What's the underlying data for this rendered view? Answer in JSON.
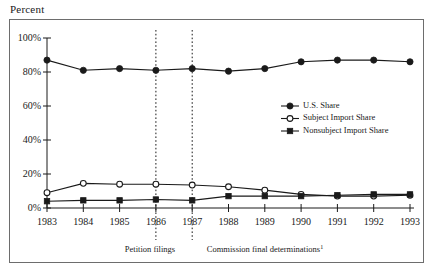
{
  "figure": {
    "axis_caption": "Percent",
    "footnote_marker": "1"
  },
  "chart_data": {
    "type": "line",
    "title": "",
    "xlabel": "",
    "ylabel": "Percent",
    "categories": [
      "1983",
      "1984",
      "1985",
      "1986",
      "1987",
      "1988",
      "1989",
      "1990",
      "1991",
      "1992",
      "1993"
    ],
    "x": [
      1983,
      1984,
      1985,
      1986,
      1987,
      1988,
      1989,
      1990,
      1991,
      1992,
      1993
    ],
    "xlim": [
      1983,
      1993
    ],
    "ylim": [
      0,
      100
    ],
    "ytick_labels": [
      "0%",
      "20%",
      "40%",
      "60%",
      "80%",
      "100%"
    ],
    "ytick_values": [
      0,
      20,
      40,
      60,
      80,
      100
    ],
    "grid": false,
    "legend_position": "center-right",
    "series": [
      {
        "name": "U.S. Share",
        "marker": "filled-circle",
        "values": [
          87,
          81,
          82,
          81,
          82,
          80.5,
          82,
          86,
          87,
          87,
          86
        ]
      },
      {
        "name": "Subject Import Share",
        "marker": "open-circle",
        "values": [
          9,
          14.5,
          14,
          14,
          13.5,
          12.5,
          10.5,
          8,
          7,
          7,
          7.5
        ]
      },
      {
        "name": "Nonsubject Import Share",
        "marker": "filled-square",
        "values": [
          4,
          4.5,
          4.5,
          5,
          4.5,
          7,
          7,
          7,
          7.5,
          8,
          8
        ]
      }
    ],
    "annotations": [
      {
        "label": "Petition filings",
        "at_x": 1986
      },
      {
        "label": "Commission final determinations",
        "at_x": 1987,
        "superscript": "1"
      }
    ]
  },
  "legend": {
    "items": [
      {
        "label": "U.S. Share",
        "marker": "filled-circle"
      },
      {
        "label": "Subject Import Share",
        "marker": "open-circle"
      },
      {
        "label": "Nonsubject Import Share",
        "marker": "filled-square"
      }
    ]
  }
}
